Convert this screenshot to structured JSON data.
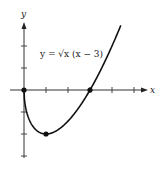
{
  "chart_data": {
    "type": "line",
    "title": "",
    "equation_label": "y = √x (x − 3)",
    "xlabel": "x",
    "ylabel": "y",
    "xlim": [
      0,
      5.5
    ],
    "ylim": [
      -3,
      3
    ],
    "x_ticks": [
      1,
      2,
      3,
      4,
      5
    ],
    "y_ticks": [
      -3,
      -2,
      -1,
      1,
      2
    ],
    "grid": false,
    "legend": "none",
    "series": [
      {
        "name": "y = √x (x − 3)",
        "function": "sqrt(x)*(x-3)",
        "x": [
          0,
          0.25,
          0.5,
          1,
          1.5,
          2,
          2.5,
          3,
          3.5,
          4,
          4.4
        ],
        "values": [
          0,
          -0.69,
          -1.77,
          -2,
          -1.84,
          -1.41,
          -0.79,
          0,
          0.94,
          2,
          2.94
        ]
      }
    ],
    "marked_points": [
      {
        "x": 0,
        "y": 0,
        "label": "origin"
      },
      {
        "x": 1,
        "y": -2,
        "label": "minimum"
      },
      {
        "x": 3,
        "y": 0,
        "label": "root"
      }
    ]
  },
  "labels": {
    "x_axis": "x",
    "y_axis": "y",
    "equation": "y = √x (x − 3)"
  }
}
